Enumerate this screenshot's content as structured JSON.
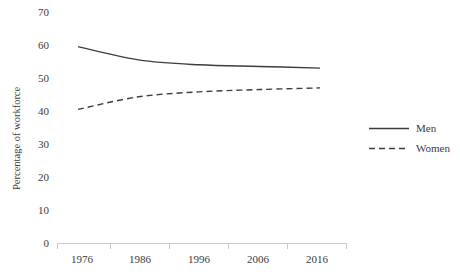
{
  "chart_data": {
    "type": "line",
    "title": "",
    "xlabel": "",
    "ylabel": "Percentage of workforce",
    "x": [
      1976,
      1986,
      1996,
      2006,
      2016
    ],
    "categories": [
      "1976",
      "1986",
      "1996",
      "2006",
      "2016"
    ],
    "series": [
      {
        "name": "Men",
        "style": "solid",
        "values": [
          59.5,
          55.5,
          54.0,
          53.5,
          53.0
        ]
      },
      {
        "name": "Women",
        "style": "dashed",
        "values": [
          40.5,
          44.3,
          45.8,
          46.5,
          47.0
        ]
      }
    ],
    "ylim": [
      0,
      70
    ],
    "ytick_labels": [
      "0",
      "10",
      "20",
      "30",
      "40",
      "50",
      "60",
      "70"
    ],
    "ytick_values": [
      0,
      10,
      20,
      30,
      40,
      50,
      60,
      70
    ],
    "grid": false,
    "legend_position": "right",
    "legend": [
      {
        "label": "Men",
        "style": "solid"
      },
      {
        "label": "Women",
        "style": "dashed"
      }
    ],
    "colors": {
      "series": "#3d3d3d",
      "axis": "#c9c9c9",
      "text": "#3b3b3b",
      "background": "#ffffff"
    }
  }
}
